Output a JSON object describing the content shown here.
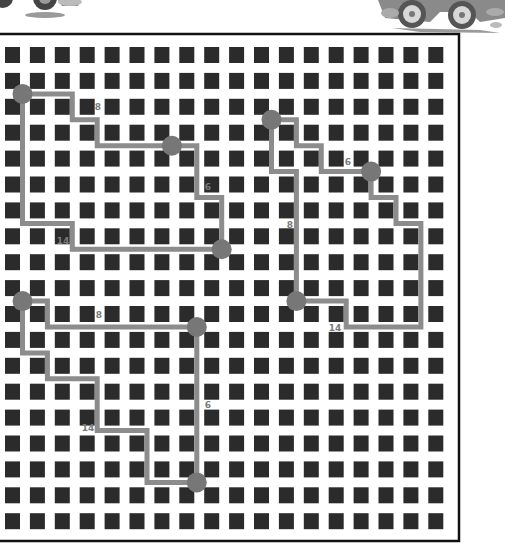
{
  "puzzle": {
    "title": "",
    "board": {
      "left": 0,
      "top": 34,
      "right": 459,
      "bottom": 541,
      "border_color": "#111111",
      "columns": 18,
      "rows": 19,
      "cell_x0": 5,
      "cell_y0": 47,
      "pitch_x": 24.9,
      "pitch_y": 25.9,
      "cell_w": 15,
      "cell_h": 16,
      "cell_color": "#2b2b2b",
      "gap_x0": 22.5,
      "gap_y0": 68
    },
    "colors": {
      "path": "#8c8c8c",
      "node": "#777777",
      "label": "#7a7a7a"
    },
    "routes": [
      {
        "name": "top-left-loop",
        "points": [
          [
            0,
            1
          ],
          [
            2,
            1
          ],
          [
            2,
            2
          ],
          [
            3,
            2
          ],
          [
            3,
            3
          ],
          [
            6,
            3
          ],
          [
            7,
            3
          ],
          [
            7,
            5
          ],
          [
            8,
            5
          ],
          [
            8,
            7
          ],
          [
            2,
            7
          ],
          [
            2,
            6
          ],
          [
            0,
            6
          ],
          [
            0,
            1
          ]
        ],
        "nodes": [
          [
            0,
            1
          ],
          [
            6,
            3
          ],
          [
            8,
            7
          ]
        ],
        "labels": [
          {
            "text": "8",
            "x": 98,
            "y": 110
          },
          {
            "text": "6",
            "x": 208,
            "y": 190
          },
          {
            "text": "14",
            "x": 63,
            "y": 244
          }
        ]
      },
      {
        "name": "right-loop",
        "points": [
          [
            10,
            2
          ],
          [
            11,
            2
          ],
          [
            11,
            3
          ],
          [
            12,
            3
          ],
          [
            12,
            4
          ],
          [
            14,
            4
          ],
          [
            14,
            5
          ],
          [
            15,
            5
          ],
          [
            15,
            6
          ],
          [
            16,
            6
          ],
          [
            16,
            10
          ],
          [
            13,
            10
          ],
          [
            13,
            9
          ],
          [
            11,
            9
          ],
          [
            11,
            4
          ],
          [
            10,
            4
          ],
          [
            10,
            2
          ]
        ],
        "nodes": [
          [
            10,
            2
          ],
          [
            14,
            4
          ],
          [
            11,
            9
          ]
        ],
        "labels": [
          {
            "text": "6",
            "x": 348,
            "y": 165
          },
          {
            "text": "8",
            "x": 290,
            "y": 228
          },
          {
            "text": "14",
            "x": 335,
            "y": 331
          }
        ]
      },
      {
        "name": "bottom-left-loop",
        "points": [
          [
            0,
            9
          ],
          [
            1,
            9
          ],
          [
            1,
            10
          ],
          [
            7,
            10
          ],
          [
            7,
            16
          ],
          [
            5,
            16
          ],
          [
            5,
            14
          ],
          [
            3,
            14
          ],
          [
            3,
            12
          ],
          [
            1,
            12
          ],
          [
            1,
            11
          ],
          [
            0,
            11
          ],
          [
            0,
            9
          ]
        ],
        "nodes": [
          [
            0,
            9
          ],
          [
            7,
            10
          ],
          [
            7,
            16
          ]
        ],
        "labels": [
          {
            "text": "8",
            "x": 99,
            "y": 318
          },
          {
            "text": "6",
            "x": 208,
            "y": 408
          },
          {
            "text": "14",
            "x": 88,
            "y": 431
          }
        ]
      }
    ],
    "decorations": [
      {
        "name": "car-left",
        "icon": "cartoon-car-icon"
      },
      {
        "name": "car-right",
        "icon": "cartoon-car-icon"
      }
    ]
  }
}
